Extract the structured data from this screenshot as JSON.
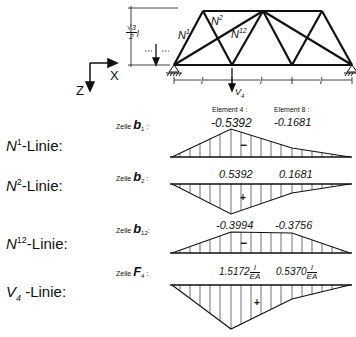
{
  "figure": {
    "truss": {
      "members": [
        "N1",
        "N2",
        "N12"
      ],
      "member_labels": {
        "n1": "N",
        "n1_sup": "1",
        "n2": "N",
        "n2_sup": "2",
        "n12": "N",
        "n12_sup": "12"
      },
      "height_label": {
        "num": "√3",
        "den": "2",
        "suffix": "l"
      },
      "span_label": "l",
      "load_label": "V",
      "load_sub": "4",
      "axes": {
        "x": "X",
        "z": "Z"
      }
    },
    "header": {
      "element4": "Element 4 :",
      "element8": "Element 8 :"
    },
    "rows": [
      {
        "name": "N1",
        "label_main": "N",
        "label_sup": "1",
        "label_suffix": "-Linie:",
        "zeile_prefix": "Zeile",
        "zeile_var": "b",
        "zeile_sub": "1",
        "v1": "-0.5392",
        "v2": "-0.1681",
        "sign": "−"
      },
      {
        "name": "N2",
        "label_main": "N",
        "label_sup": "2",
        "label_suffix": "-Linie:",
        "zeile_prefix": "Zeile",
        "zeile_var": "b",
        "zeile_sub": "2",
        "v1": "0.5392",
        "v2": "0.1681",
        "sign": "+"
      },
      {
        "name": "N12",
        "label_main": "N",
        "label_sup": "12",
        "label_suffix": "-Linie:",
        "zeile_prefix": "Zeile",
        "zeile_var": "b",
        "zeile_sub": "12",
        "v1": "-0.3994",
        "v2": "-0.3756",
        "sign": "−"
      },
      {
        "name": "V4",
        "label_main": "V",
        "label_sub": "4",
        "label_suffix": " -Linie:",
        "zeile_prefix": "Zeile",
        "zeile_var": "F",
        "zeile_sub": "4",
        "v1": "1.5172",
        "v2": "0.5370",
        "frac_num": "l",
        "frac_den": "EA",
        "sign": "+"
      }
    ]
  }
}
